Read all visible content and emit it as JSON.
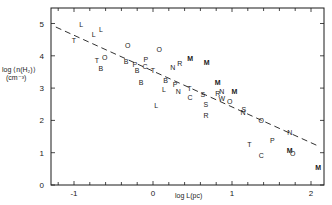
{
  "chart_data": {
    "type": "scatter",
    "title": "",
    "xlabel": "log L(pc)",
    "ylabel": "log ⟨n(H₂)⟩ (cm⁻³)",
    "ylabel_line1": "log ⟨n(H₂)⟩",
    "ylabel_line2": "(cm⁻³)",
    "xlim": [
      -1.3,
      2.2
    ],
    "ylim": [
      0,
      5.5
    ],
    "x_ticks": [
      -1,
      0,
      1,
      2
    ],
    "x_tick_labels": [
      "-1",
      "0",
      "1",
      "2"
    ],
    "x_minor_step": 0.2,
    "y_ticks": [
      0,
      1,
      2,
      3,
      4,
      5
    ],
    "y_tick_labels": [
      "0",
      "1",
      "2",
      "3",
      "4",
      "5"
    ],
    "grid": false,
    "legend": null,
    "marker_style": "letter symbols",
    "fit_line": {
      "style": "dashed",
      "x": [
        -1.23,
        2.08
      ],
      "y": [
        4.89,
        1.22
      ]
    },
    "points": [
      {
        "label": "L",
        "x": -0.91,
        "y": 4.98
      },
      {
        "label": "L",
        "x": -0.75,
        "y": 4.67
      },
      {
        "label": "L",
        "x": -0.66,
        "y": 4.8
      },
      {
        "label": "T",
        "x": -1.0,
        "y": 4.46
      },
      {
        "label": "O",
        "x": -0.61,
        "y": 3.96
      },
      {
        "label": "T",
        "x": -0.71,
        "y": 3.84
      },
      {
        "label": "B",
        "x": -0.66,
        "y": 3.62
      },
      {
        "label": "O",
        "x": -0.32,
        "y": 4.33
      },
      {
        "label": "O",
        "x": 0.08,
        "y": 4.21
      },
      {
        "label": "B",
        "x": -0.34,
        "y": 3.81
      },
      {
        "label": "P",
        "x": -0.23,
        "y": 3.72
      },
      {
        "label": "B",
        "x": -0.2,
        "y": 3.56
      },
      {
        "label": "C",
        "x": -0.1,
        "y": 3.68
      },
      {
        "label": "P",
        "x": -0.09,
        "y": 3.87
      },
      {
        "label": "T",
        "x": 0.0,
        "y": 3.56
      },
      {
        "label": "B",
        "x": -0.15,
        "y": 3.16
      },
      {
        "label": "L",
        "x": 0.04,
        "y": 2.45
      },
      {
        "label": "N",
        "x": 0.25,
        "y": 3.65
      },
      {
        "label": "R",
        "x": 0.34,
        "y": 3.75
      },
      {
        "label": "M",
        "x": 0.47,
        "y": 3.93
      },
      {
        "label": "M",
        "x": 0.68,
        "y": 3.78
      },
      {
        "label": "B",
        "x": 0.16,
        "y": 3.25
      },
      {
        "label": "L",
        "x": 0.14,
        "y": 2.97
      },
      {
        "label": "P",
        "x": 0.28,
        "y": 3.1
      },
      {
        "label": "N",
        "x": 0.32,
        "y": 2.91
      },
      {
        "label": "T",
        "x": 0.46,
        "y": 3.0
      },
      {
        "label": "C",
        "x": 0.47,
        "y": 2.72
      },
      {
        "label": "S",
        "x": 0.63,
        "y": 2.79
      },
      {
        "label": "S",
        "x": 0.67,
        "y": 2.48
      },
      {
        "label": "R",
        "x": 0.67,
        "y": 2.14
      },
      {
        "label": "M",
        "x": 0.82,
        "y": 3.16
      },
      {
        "label": "R",
        "x": 0.82,
        "y": 2.82
      },
      {
        "label": "N",
        "x": 0.87,
        "y": 2.91
      },
      {
        "label": "W",
        "x": 0.87,
        "y": 2.69
      },
      {
        "label": "M",
        "x": 1.03,
        "y": 2.91
      },
      {
        "label": "O",
        "x": 0.97,
        "y": 2.6
      },
      {
        "label": "S",
        "x": 1.15,
        "y": 2.35
      },
      {
        "label": "N",
        "x": 1.14,
        "y": 2.23
      },
      {
        "label": "O",
        "x": 1.37,
        "y": 2.01
      },
      {
        "label": "N",
        "x": 1.73,
        "y": 1.64
      },
      {
        "label": "T",
        "x": 1.22,
        "y": 1.24
      },
      {
        "label": "P",
        "x": 1.51,
        "y": 1.39
      },
      {
        "label": "C",
        "x": 1.37,
        "y": 0.9
      },
      {
        "label": "M",
        "x": 1.73,
        "y": 1.08
      },
      {
        "label": "O",
        "x": 1.77,
        "y": 0.96
      },
      {
        "label": "M",
        "x": 2.09,
        "y": 0.53
      }
    ]
  },
  "colors": {
    "ink": "#1a1a1a",
    "background": "#ffffff"
  }
}
